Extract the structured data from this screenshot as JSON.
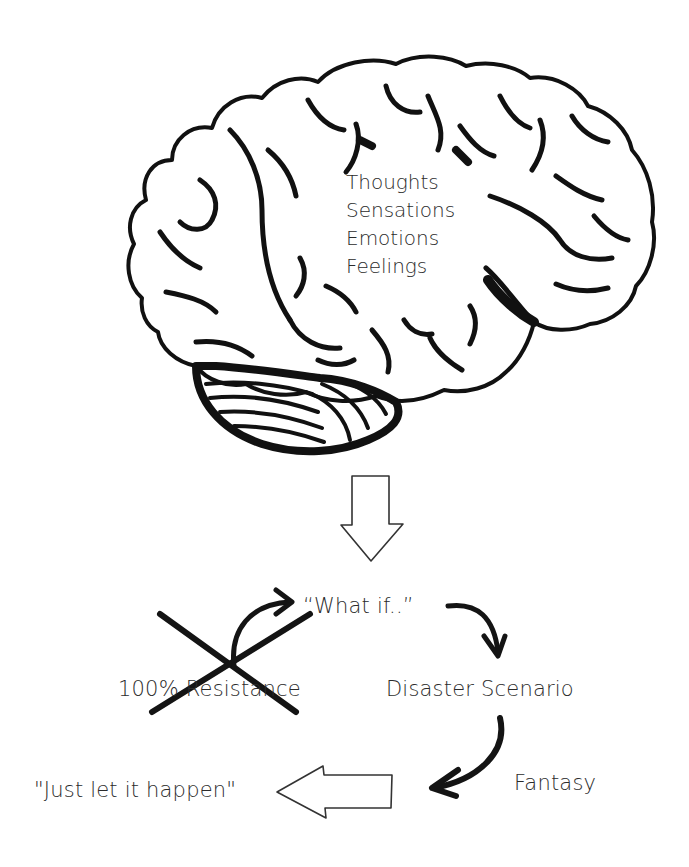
{
  "diagram": {
    "brain": {
      "icon": "brain-icon",
      "inner_labels": [
        "Thoughts",
        "Sensations",
        "Emotions",
        "Feelings"
      ]
    },
    "down_arrow": {
      "icon": "hollow-down-arrow-icon"
    },
    "nodes": {
      "what_if": "“What if..”",
      "resistance": "100% Resistance",
      "disaster": "Disaster Scenario",
      "fantasy": "Fantasy",
      "let_it_happen": "\"Just let it happen\""
    },
    "connectors": [
      {
        "from": "resistance",
        "to": "what_if",
        "icon": "curved-arrow-icon"
      },
      {
        "from": "what_if",
        "to": "disaster",
        "icon": "curved-arrow-icon"
      },
      {
        "from": "disaster",
        "to": "fantasy",
        "icon": "curved-arrow-icon"
      },
      {
        "from": "fantasy",
        "to": "let_it_happen",
        "icon": "hollow-left-arrow-icon"
      }
    ],
    "crossed_out": {
      "target": "resistance",
      "icon": "cross-out-x-icon"
    },
    "colors": {
      "ink": "#111111",
      "text": "#2b2b2b",
      "background": "#ffffff"
    }
  }
}
